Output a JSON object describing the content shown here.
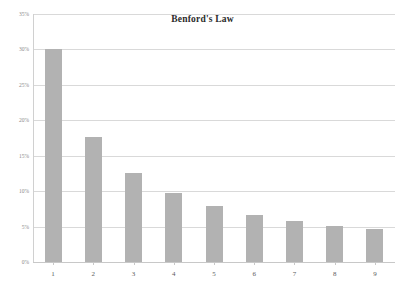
{
  "chart_data": {
    "type": "bar",
    "title": "Benford's Law",
    "xlabel": "",
    "ylabel": "",
    "categories": [
      "1",
      "2",
      "3",
      "4",
      "5",
      "6",
      "7",
      "8",
      "9"
    ],
    "values": [
      30.1,
      17.6,
      12.5,
      9.7,
      7.9,
      6.7,
      5.8,
      5.1,
      4.6
    ],
    "ylim": [
      0,
      35
    ],
    "ytick_values": [
      0,
      5,
      10,
      15,
      20,
      25,
      30,
      35
    ],
    "ytick_labels": [
      "0%",
      "5%",
      "10%",
      "15%",
      "20%",
      "25%",
      "30%",
      "35%"
    ],
    "grid": true,
    "legend": false,
    "legend_position": "none",
    "bar_color": "#b2b2b2",
    "gridline_color": "#d9d9d9",
    "background_color": "#ffffff",
    "title_color": "#2b2b2b",
    "axis_label_color": "#5c5c5c",
    "ytick_label_color": "#8a8a8a"
  }
}
